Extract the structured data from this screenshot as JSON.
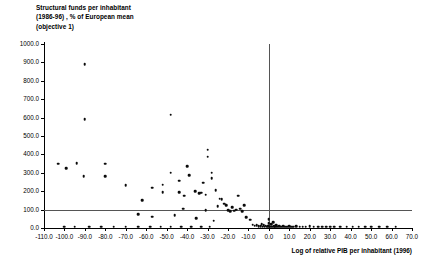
{
  "title": {
    "line1": "Structural funds per inhabitant",
    "line2": "(1986-96) , % of European mean",
    "line3": "(objective 1)"
  },
  "chart_data": {
    "type": "scatter",
    "title": "Structural funds per inhabitant (1986-96) , % of European mean (objective 1)",
    "xlabel": "Log of relative PIB per inhabitant (1996)",
    "ylabel": "Structural funds per inhabitant (1986-96) , % of European mean (objective 1)",
    "xlim": [
      -110.0,
      70.0
    ],
    "ylim": [
      0.0,
      1000.0
    ],
    "xticks": [
      "-110.0",
      "-100.0",
      "-90.0",
      "-80.0",
      "-70.0",
      "-60.0",
      "-50.0",
      "-40.0",
      "-30.0",
      "-20.0",
      "-10.0",
      "0.0",
      "10.0",
      "20.0",
      "30.0",
      "40.0",
      "50.0",
      "60.0",
      "70.0"
    ],
    "yticks": [
      "0.0",
      "100.0",
      "200.0",
      "300.0",
      "400.0",
      "500.0",
      "600.0",
      "700.0",
      "800.0",
      "900.0",
      "1000.0"
    ],
    "grid": false,
    "legend": false,
    "marker_color": "#0a0a0a",
    "reference_lines": [
      {
        "axis": "y",
        "value": 100.0,
        "color": "#555555"
      },
      {
        "axis": "x",
        "value": 0.0,
        "color": "#555555"
      }
    ],
    "points": [
      [
        -90.0,
        890.0
      ],
      [
        -90.0,
        590.0
      ],
      [
        -48.0,
        615.0
      ],
      [
        -103.0,
        350.0
      ],
      [
        -99.0,
        325.0
      ],
      [
        -94.0,
        352.0
      ],
      [
        -90.5,
        283.0
      ],
      [
        -80.0,
        350.0
      ],
      [
        -80.0,
        280.0
      ],
      [
        -70.0,
        232.0
      ],
      [
        -57.0,
        218.0
      ],
      [
        -52.0,
        235.0
      ],
      [
        -52.0,
        195.0
      ],
      [
        -48.0,
        300.0
      ],
      [
        -44.0,
        258.0
      ],
      [
        -44.0,
        196.0
      ],
      [
        -41.5,
        175.0
      ],
      [
        -40.0,
        336.0
      ],
      [
        -39.0,
        287.0
      ],
      [
        -36.0,
        200.0
      ],
      [
        -34.0,
        188.0
      ],
      [
        -33.0,
        192.0
      ],
      [
        -32.0,
        247.0
      ],
      [
        -31.0,
        180.0
      ],
      [
        -30.0,
        425.0
      ],
      [
        -30.0,
        388.0
      ],
      [
        -28.0,
        270.0
      ],
      [
        -28.0,
        300.0
      ],
      [
        -26.0,
        205.0
      ],
      [
        -25.0,
        120.0
      ],
      [
        -24.0,
        160.0
      ],
      [
        -23.0,
        155.0
      ],
      [
        -22.0,
        132.0
      ],
      [
        -21.0,
        125.0
      ],
      [
        -20.0,
        98.0
      ],
      [
        -19.0,
        90.0
      ],
      [
        -18.0,
        112.0
      ],
      [
        -17.0,
        95.0
      ],
      [
        -16.0,
        100.0
      ],
      [
        -15.0,
        175.0
      ],
      [
        -14.0,
        105.0
      ],
      [
        -13.0,
        90.0
      ],
      [
        -62.0,
        150.0
      ],
      [
        -64.0,
        75.0
      ],
      [
        -57.0,
        62.0
      ],
      [
        -46.0,
        70.0
      ],
      [
        -42.0,
        105.0
      ],
      [
        -35.5,
        52.0
      ],
      [
        -31.0,
        98.0
      ],
      [
        -27.0,
        40.0
      ],
      [
        -12.0,
        125.0
      ],
      [
        -11.0,
        60.0
      ],
      [
        -9.0,
        45.0
      ],
      [
        -8.0,
        18.0
      ],
      [
        -7.0,
        12.0
      ],
      [
        -6.0,
        14.0
      ],
      [
        -5.0,
        10.0
      ],
      [
        -4.0,
        9.0
      ],
      [
        -3.5,
        22.0
      ],
      [
        -3.0,
        8.0
      ],
      [
        -2.5,
        16.0
      ],
      [
        -2.0,
        7.0
      ],
      [
        -1.5,
        12.0
      ],
      [
        -1.0,
        6.0
      ],
      [
        -0.5,
        9.0
      ],
      [
        0.0,
        48.0
      ],
      [
        0.0,
        25.0
      ],
      [
        0.0,
        10.0
      ],
      [
        0.5,
        8.0
      ],
      [
        1.0,
        20.0
      ],
      [
        1.5,
        7.0
      ],
      [
        2.0,
        30.0
      ],
      [
        2.5,
        9.0
      ],
      [
        3.0,
        6.0
      ],
      [
        3.5,
        14.0
      ],
      [
        4.0,
        8.0
      ],
      [
        5.0,
        11.0
      ],
      [
        6.0,
        7.0
      ],
      [
        7.0,
        9.0
      ],
      [
        8.0,
        6.0
      ],
      [
        9.0,
        8.0
      ],
      [
        10.0,
        10.0
      ],
      [
        11.0,
        6.0
      ],
      [
        12.0,
        7.0
      ],
      [
        13.5,
        9.0
      ],
      [
        15.0,
        6.0
      ],
      [
        16.5,
        8.0
      ],
      [
        18.0,
        7.0
      ],
      [
        20.0,
        9.0
      ],
      [
        22.0,
        6.0
      ],
      [
        24.0,
        7.0
      ],
      [
        26.0,
        6.0
      ],
      [
        28.0,
        8.0
      ],
      [
        30.0,
        6.0
      ],
      [
        32.0,
        7.0
      ],
      [
        35.0,
        6.0
      ],
      [
        38.0,
        7.0
      ],
      [
        41.0,
        6.0
      ],
      [
        44.0,
        8.0
      ],
      [
        47.0,
        6.0
      ],
      [
        50.0,
        7.0
      ],
      [
        54.0,
        6.0
      ],
      [
        58.0,
        7.0
      ],
      [
        62.0,
        6.0
      ],
      [
        -100.0,
        8.0
      ],
      [
        -95.0,
        7.0
      ],
      [
        -88.0,
        6.0
      ],
      [
        -82.0,
        8.0
      ],
      [
        -76.0,
        6.0
      ],
      [
        -70.0,
        7.0
      ],
      [
        -64.0,
        6.0
      ],
      [
        -58.0,
        7.0
      ],
      [
        -53.0,
        6.0
      ],
      [
        -48.0,
        8.0
      ],
      [
        -43.0,
        6.0
      ],
      [
        -38.0,
        7.0
      ],
      [
        -33.0,
        6.0
      ],
      [
        -29.0,
        8.0
      ]
    ]
  },
  "x_axis_caption": "Log of relative PIB per inhabitant (1996)"
}
